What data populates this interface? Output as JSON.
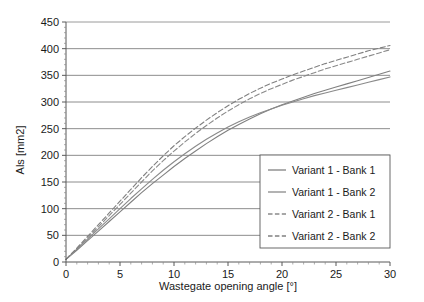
{
  "chart_data": {
    "type": "line",
    "title": "",
    "xlabel": "Wastegate opening angle [°]",
    "ylabel": "Als [mm2]",
    "xlim": [
      0,
      30
    ],
    "ylim": [
      0,
      450
    ],
    "xticks": [
      0,
      5,
      10,
      15,
      20,
      25,
      30
    ],
    "xticklabels": [
      "0",
      "5",
      "10",
      "15",
      "20",
      "25",
      "30"
    ],
    "xminor_step": 1,
    "yticks": [
      0,
      50,
      100,
      150,
      200,
      250,
      300,
      350,
      400,
      450
    ],
    "yticklabels": [
      "0",
      "50",
      "100",
      "150",
      "200",
      "250",
      "300",
      "350",
      "400",
      "450"
    ],
    "grid": "horizontal",
    "legend_position": "lower-right-inside",
    "x": [
      0,
      1,
      2,
      3,
      4,
      5,
      6,
      7,
      8,
      9,
      10,
      11,
      12,
      13,
      14,
      15,
      16,
      17,
      18,
      19,
      20,
      21,
      22,
      23,
      24,
      25,
      26,
      27,
      28,
      29,
      30
    ],
    "series": [
      {
        "name": "Variant 1 - Bank 1",
        "style": "solid",
        "color": "#808080",
        "values": [
          5,
          22,
          40,
          58,
          76,
          94,
          112,
          130,
          147,
          163,
          179,
          194,
          208,
          222,
          235,
          247,
          258,
          268,
          278,
          287,
          295,
          302,
          309,
          316,
          322,
          328,
          334,
          340,
          346,
          352,
          358
        ]
      },
      {
        "name": "Variant 1 - Bank 2",
        "style": "solid",
        "color": "#8a8a8a",
        "values": [
          5,
          24,
          43,
          62,
          81,
          100,
          119,
          137,
          155,
          172,
          188,
          203,
          217,
          230,
          242,
          253,
          263,
          272,
          280,
          287,
          294,
          300,
          306,
          312,
          317,
          322,
          327,
          332,
          337,
          342,
          347
        ]
      },
      {
        "name": "Variant 2 - Bank 1",
        "style": "dashed",
        "color": "#8a8a8a",
        "values": [
          5,
          25,
          45,
          66,
          87,
          108,
          129,
          150,
          171,
          190,
          208,
          225,
          241,
          256,
          270,
          283,
          295,
          306,
          316,
          325,
          333,
          341,
          348,
          355,
          362,
          368,
          374,
          380,
          386,
          392,
          398
        ]
      },
      {
        "name": "Variant 2 - Bank 2",
        "style": "dashed",
        "color": "#808080",
        "values": [
          5,
          26,
          48,
          70,
          92,
          114,
          136,
          158,
          179,
          199,
          218,
          235,
          251,
          266,
          280,
          293,
          305,
          316,
          326,
          335,
          343,
          351,
          358,
          365,
          372,
          378,
          384,
          390,
          396,
          401,
          406
        ]
      }
    ],
    "legend_entries": [
      "Variant 1 - Bank 1",
      "Variant 1 - Bank 2",
      "Variant 2 - Bank 1",
      "Variant 2 - Bank 2"
    ],
    "colors": {
      "background": "#ffffff",
      "axis": "#595959",
      "gridline": "#808080",
      "text": "#1a1a1a",
      "legend_border": "#595959",
      "legend_fill": "#ffffff"
    }
  }
}
